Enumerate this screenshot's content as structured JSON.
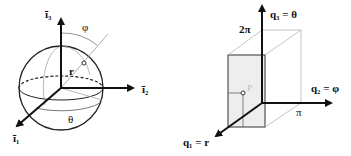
{
  "left_diagram": {
    "title": "spherical coordinates",
    "axes": {
      "i1": "ī₁",
      "i2": "ī₂",
      "i3": "ī₃"
    },
    "labels": {
      "phi": "φ",
      "theta": "θ",
      "r": "r"
    }
  },
  "right_diagram": {
    "title": "coordinate space",
    "axes": {
      "q1": "q₁ = r",
      "q2": "q₂ = φ",
      "q3": "q₃ = θ"
    },
    "ticks": {
      "two_pi": "2π",
      "pi": "π"
    },
    "point": "P"
  },
  "colors": {
    "line": "#111111",
    "thin": "#888888",
    "shade": "#eeeeee"
  }
}
